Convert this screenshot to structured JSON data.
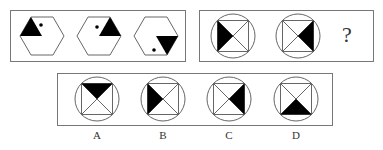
{
  "puzzle": {
    "row1_left": {
      "description": "Three hexagons, each containing a black triangle and a dot",
      "figures": [
        {
          "shape": "hexagon",
          "triangle": "upper-left, pointing up",
          "dot": "upper-right of triangle"
        },
        {
          "shape": "hexagon",
          "triangle": "upper-right, pointing up",
          "dot": "left of triangle"
        },
        {
          "shape": "hexagon",
          "triangle": "lower-right, pointing down",
          "dot": "lower-left"
        }
      ]
    },
    "row1_right": {
      "description": "Circles with inscribed square and diagonals; one quarter shaded",
      "figures": [
        {
          "shaded": "left"
        },
        {
          "shaded": "right"
        }
      ],
      "question_mark": "?"
    },
    "options": [
      {
        "label": "A",
        "shaded": "top"
      },
      {
        "label": "B",
        "shaded": "left"
      },
      {
        "label": "C",
        "shaded": "right"
      },
      {
        "label": "D",
        "shaded": "bottom"
      }
    ]
  }
}
